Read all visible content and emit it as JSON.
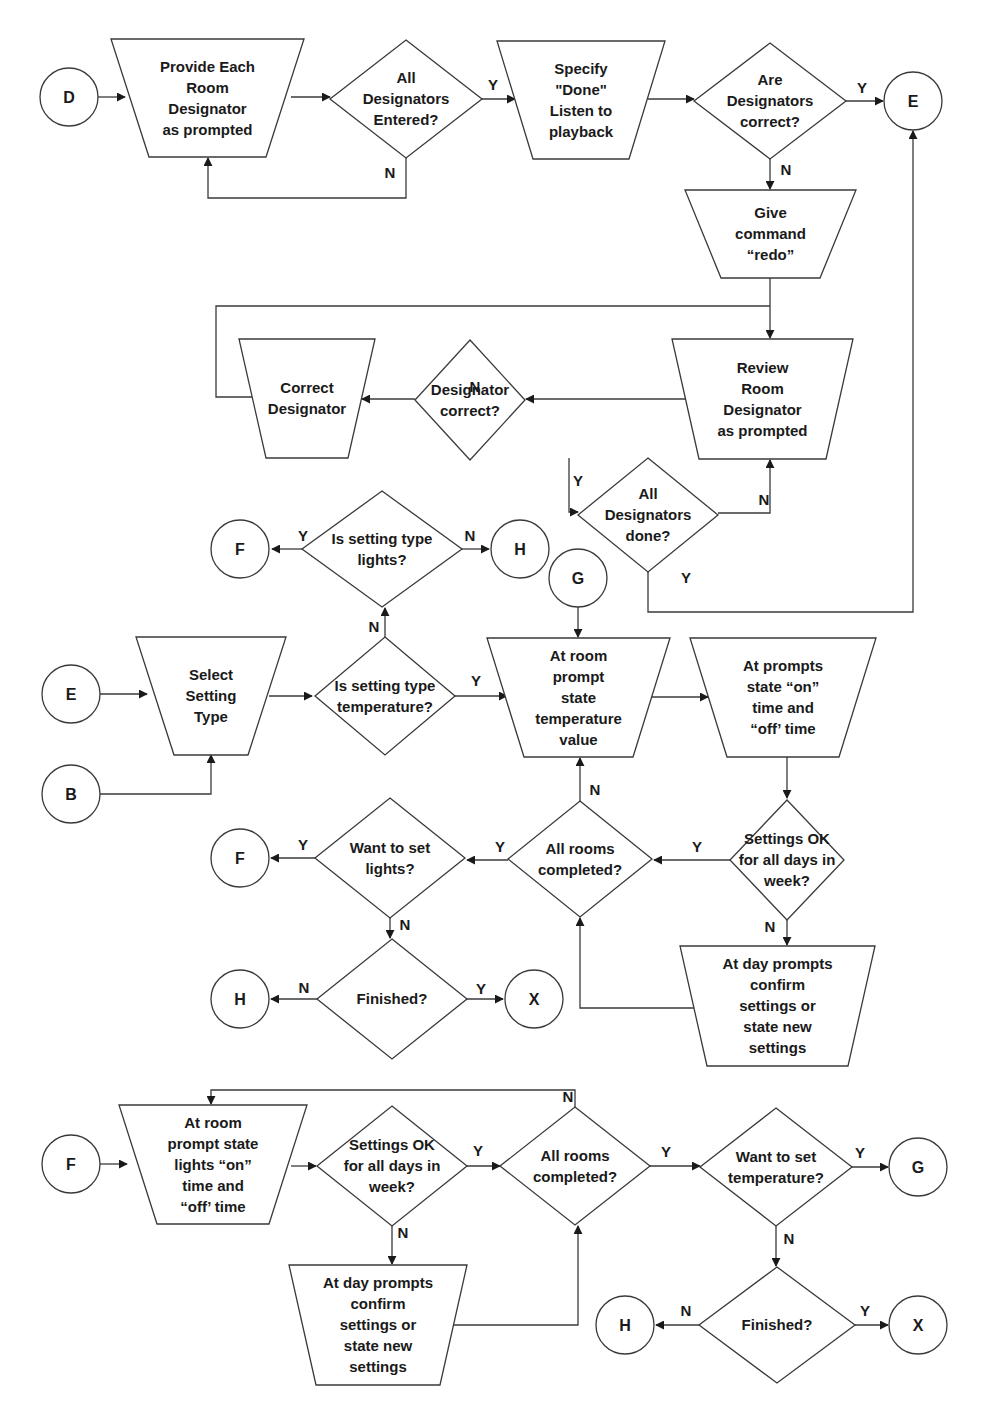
{
  "colors": {
    "stroke": "#3a3a3a",
    "text": "#1a1a1a",
    "background": "#ffffff"
  },
  "connectors": {
    "d_start": "D",
    "e_end_top": "E",
    "f_lights_q": "F",
    "h_lights_q": "H",
    "g_temp": "G",
    "e_start_mid": "E",
    "b_start": "B",
    "f_want_lights": "F",
    "h_finished_mid": "H",
    "x_finished_mid": "X",
    "f_start_bottom": "F",
    "g_want_temp": "G",
    "h_finished_bottom": "H",
    "x_finished_bottom": "X"
  },
  "nodes": {
    "provide_designator": [
      "Provide Each",
      "Room",
      "Designator",
      "as prompted"
    ],
    "all_entered": [
      "All",
      "Designators",
      "Entered?"
    ],
    "specify_done": [
      "Specify",
      "\"Done\"",
      "Listen to",
      "playback"
    ],
    "are_correct": [
      "Are",
      "Designators",
      "correct?"
    ],
    "give_redo": [
      "Give",
      "command",
      "“redo”"
    ],
    "review_designator": [
      "Review",
      "Room",
      "Designator",
      "as prompted"
    ],
    "designator_correct": [
      "Designator",
      "correct?"
    ],
    "correct_designator": [
      "Correct",
      "Designator"
    ],
    "all_done": [
      "All",
      "Designators",
      "done?"
    ],
    "is_lights": [
      "Is setting type",
      "lights?"
    ],
    "select_type": [
      "Select",
      "Setting",
      "Type"
    ],
    "is_temperature": [
      "Is setting type",
      "temperature?"
    ],
    "state_temperature": [
      "At room",
      "prompt",
      "state",
      "temperature",
      "value"
    ],
    "state_on_off": [
      "At prompts",
      "state “on”",
      "time and",
      "“off’ time"
    ],
    "settings_ok_mid": [
      "Settings OK",
      "for all days in",
      "week?"
    ],
    "all_rooms_mid": [
      "All rooms",
      "completed?"
    ],
    "want_lights": [
      "Want to set",
      "lights?"
    ],
    "finished_mid": [
      "Finished?"
    ],
    "day_prompts_mid": [
      "At day prompts",
      "confirm",
      "settings or",
      "state new",
      "settings"
    ],
    "lights_on_off": [
      "At room",
      "prompt state",
      "lights “on”",
      "time and",
      "“off’ time"
    ],
    "settings_ok_bottom": [
      "Settings OK",
      "for all days in",
      "week?"
    ],
    "all_rooms_bottom": [
      "All rooms",
      "completed?"
    ],
    "want_temperature": [
      "Want to set",
      "temperature?"
    ],
    "day_prompts_bottom": [
      "At day prompts",
      "confirm",
      "settings or",
      "state new",
      "settings"
    ],
    "finished_bottom": [
      "Finished?"
    ]
  },
  "branch_labels": {
    "yes": "Y",
    "no": "N"
  }
}
